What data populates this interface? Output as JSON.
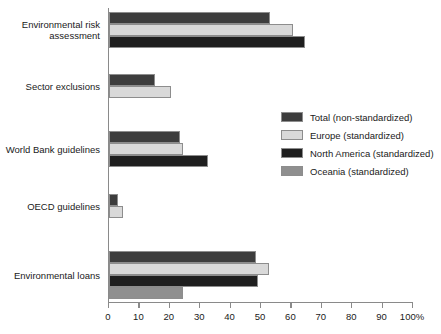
{
  "chart_data": {
    "type": "bar",
    "orientation": "horizontal",
    "title": "",
    "xlabel": "",
    "ylabel": "",
    "xlim": [
      0,
      100
    ],
    "xticks": [
      0,
      10,
      20,
      30,
      40,
      50,
      60,
      70,
      80,
      90,
      100
    ],
    "xtick_labels": [
      "0",
      "10",
      "20",
      "30",
      "40",
      "50",
      "60",
      "70",
      "80",
      "90",
      "100%"
    ],
    "grid": false,
    "legend_position": "middle-right",
    "categories": [
      "Environmental risk\nassessment",
      "Sector exclusions",
      "World Bank guidelines",
      "OECD guidelines",
      "Environmental loans"
    ],
    "series": [
      {
        "name": "Total (non-standardized)",
        "color": "#3d3d3d",
        "values": [
          53,
          15,
          23.5,
          3,
          48.5
        ]
      },
      {
        "name": "Europe (standardized)",
        "color": "#d9d9d9",
        "values": [
          60.5,
          20.5,
          24.5,
          4.5,
          52.5
        ]
      },
      {
        "name": "North America (standardized)",
        "color": "#1f1f1f",
        "values": [
          64.5,
          null,
          32.5,
          null,
          49
        ]
      },
      {
        "name": "Oceania (standardized)",
        "color": "#8f8f8f",
        "values": [
          null,
          null,
          null,
          null,
          24.5
        ]
      }
    ]
  },
  "legend": {
    "items": [
      {
        "label": "Total (non-standardized)",
        "color": "#3d3d3d"
      },
      {
        "label": "Europe (standardized)",
        "color": "#d9d9d9"
      },
      {
        "label": "North America (standardized)",
        "color": "#1f1f1f"
      },
      {
        "label": "Oceania (standardized)",
        "color": "#8f8f8f"
      }
    ]
  }
}
